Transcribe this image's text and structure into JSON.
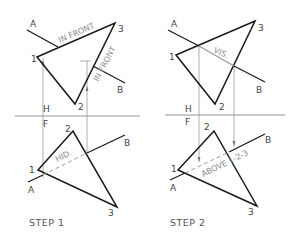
{
  "figure": {
    "folding_line_labels": {
      "top": "H",
      "bottom": "F"
    },
    "line_labels": {
      "start": "A",
      "end": "B"
    },
    "point_labels": [
      "1",
      "2",
      "3"
    ],
    "colors": {
      "lines": "#1a1a1a",
      "construction": "#9a9a9a",
      "annotation": "#8a8a8a"
    }
  },
  "step1": {
    "caption": "STEP 1",
    "top_view": {
      "A": "A",
      "B": "B",
      "p1": "1",
      "p2": "2",
      "p3": "3",
      "H": "H",
      "note_a": "IN FRONT",
      "note_b": "IN FRONT"
    },
    "front_view": {
      "A": "A",
      "B": "B",
      "p1": "1",
      "p2": "2",
      "p3": "3",
      "F": "F",
      "note": "HID."
    }
  },
  "step2": {
    "caption": "STEP 2",
    "top_view": {
      "A": "A",
      "B": "B",
      "p1": "1",
      "p2": "2",
      "p3": "3",
      "H": "H",
      "note": "VIS."
    },
    "front_view": {
      "A": "A",
      "B": "B",
      "p1": "1",
      "p2": "2",
      "p3": "3",
      "F": "F",
      "note": "ABOVE 1-2-3"
    }
  }
}
